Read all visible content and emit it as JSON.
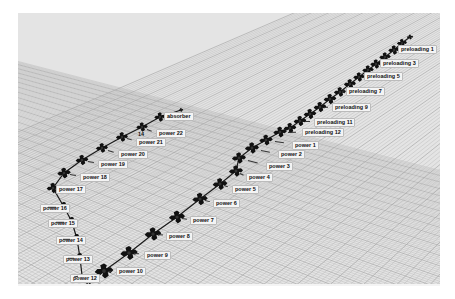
{
  "scene": {
    "type": "3d-viewport",
    "background": "#e4e4e4",
    "grid_color": "#b8b8b8",
    "node_color": "#111111"
  },
  "nodes": [
    {
      "id": "end_top",
      "label": "",
      "x": 392,
      "y": 24,
      "size": 0.5
    },
    {
      "id": "n_a",
      "label": "",
      "x": 384,
      "y": 30,
      "size": 0.8
    },
    {
      "id": "preloading1",
      "label": "preloading 1",
      "x": 376,
      "y": 37,
      "lx": 380,
      "ly": 35,
      "size": 0.9
    },
    {
      "id": "n_b",
      "label": "",
      "x": 367,
      "y": 44,
      "size": 0.9
    },
    {
      "id": "preloading3",
      "label": "preloading 3",
      "x": 358,
      "y": 51,
      "lx": 362,
      "ly": 49,
      "size": 0.9
    },
    {
      "id": "n_c",
      "label": "",
      "x": 350,
      "y": 57,
      "size": 0.9
    },
    {
      "id": "preloading5",
      "label": "preloading 5",
      "x": 341,
      "y": 64,
      "lx": 346,
      "ly": 62,
      "size": 0.9
    },
    {
      "id": "n_d",
      "label": "",
      "x": 332,
      "y": 71,
      "size": 0.95
    },
    {
      "id": "preloading7",
      "label": "preloading 7",
      "x": 322,
      "y": 79,
      "lx": 328,
      "ly": 77,
      "size": 0.95
    },
    {
      "id": "n_e",
      "label": "",
      "x": 312,
      "y": 86,
      "size": 1.0
    },
    {
      "id": "preloading9",
      "label": "preloading 9",
      "x": 302,
      "y": 94,
      "lx": 314,
      "ly": 93,
      "size": 1.0
    },
    {
      "id": "n_f",
      "label": "",
      "x": 292,
      "y": 101,
      "size": 1.0
    },
    {
      "id": "preloading11",
      "label": "preloading 11",
      "x": 282,
      "y": 108,
      "lx": 296,
      "ly": 108,
      "size": 1.0
    },
    {
      "id": "n_g",
      "label": "",
      "x": 272,
      "y": 115,
      "size": 1.0
    },
    {
      "id": "preloading12",
      "label": "preloading 12",
      "x": 262,
      "y": 119,
      "lx": 284,
      "ly": 118,
      "size": 1.05
    },
    {
      "id": "power1",
      "label": "power 1",
      "x": 248,
      "y": 127,
      "lx": 274,
      "ly": 131,
      "size": 1.05
    },
    {
      "id": "power2",
      "label": "power 2",
      "x": 234,
      "y": 135,
      "lx": 260,
      "ly": 140,
      "size": 1.1
    },
    {
      "id": "power3",
      "label": "power 3",
      "x": 221,
      "y": 145,
      "lx": 248,
      "ly": 152,
      "size": 1.1
    },
    {
      "id": "power4",
      "label": "power 4",
      "x": 218,
      "y": 158,
      "lx": 228,
      "ly": 163,
      "size": 1.1
    },
    {
      "id": "power5",
      "label": "power 5",
      "x": 202,
      "y": 171,
      "lx": 214,
      "ly": 175,
      "size": 1.15
    },
    {
      "id": "power6",
      "label": "power 6",
      "x": 182,
      "y": 186,
      "lx": 195,
      "ly": 189,
      "size": 1.2
    },
    {
      "id": "power7",
      "label": "power 7",
      "x": 159,
      "y": 204,
      "lx": 172,
      "ly": 206,
      "size": 1.25
    },
    {
      "id": "power8",
      "label": "power 8",
      "x": 135,
      "y": 221,
      "lx": 148,
      "ly": 222,
      "size": 1.3
    },
    {
      "id": "power9",
      "label": "power 9",
      "x": 111,
      "y": 240,
      "lx": 126,
      "ly": 241,
      "size": 1.35
    },
    {
      "id": "power10",
      "label": "power 10",
      "x": 86,
      "y": 258,
      "lx": 98,
      "ly": 257,
      "size": 1.45
    },
    {
      "id": "power11",
      "label": "power 11",
      "x": 70,
      "y": 272,
      "lx": 77,
      "ly": 276,
      "size": 0.0
    },
    {
      "id": "power12",
      "label": "power 12",
      "x": 64,
      "y": 262,
      "lx": 52,
      "ly": 264,
      "size": 0.0
    },
    {
      "id": "power13",
      "label": "power 13",
      "x": 62,
      "y": 245,
      "lx": 45,
      "ly": 245,
      "size": 1.0
    },
    {
      "id": "power14",
      "label": "power 14",
      "x": 59,
      "y": 226,
      "lx": 38,
      "ly": 226,
      "size": 1.0
    },
    {
      "id": "power15",
      "label": "power 15",
      "x": 54,
      "y": 209,
      "lx": 30,
      "ly": 209,
      "size": 1.0
    },
    {
      "id": "power16",
      "label": "power 16",
      "x": 46,
      "y": 194,
      "lx": 22,
      "ly": 194,
      "size": 1.0
    },
    {
      "id": "power17",
      "label": "power 17",
      "x": 35,
      "y": 175,
      "lx": 38,
      "ly": 175,
      "size": 1.0
    },
    {
      "id": "power18",
      "label": "power 18",
      "x": 46,
      "y": 160,
      "lx": 62,
      "ly": 163,
      "size": 1.05
    },
    {
      "id": "power19",
      "label": "power 19",
      "x": 64,
      "y": 147,
      "lx": 80,
      "ly": 150,
      "size": 1.0
    },
    {
      "id": "power20",
      "label": "power 20",
      "x": 84,
      "y": 135,
      "lx": 100,
      "ly": 140,
      "size": 0.95
    },
    {
      "id": "power21",
      "label": "power 21",
      "x": 104,
      "y": 124,
      "lx": 118,
      "ly": 128,
      "size": 0.95
    },
    {
      "id": "power22",
      "label": "power 22",
      "x": 124,
      "y": 114,
      "lx": 138,
      "ly": 119,
      "size": 0.9
    },
    {
      "id": "absorber",
      "label": "absorber",
      "x": 142,
      "y": 104,
      "lx": 146,
      "ly": 102,
      "size": 0.9
    },
    {
      "id": "end_left",
      "label": "",
      "x": 163,
      "y": 97,
      "size": 0.4
    }
  ],
  "extra_labels": [
    {
      "text": "14",
      "x": 118,
      "y": 121
    }
  ]
}
